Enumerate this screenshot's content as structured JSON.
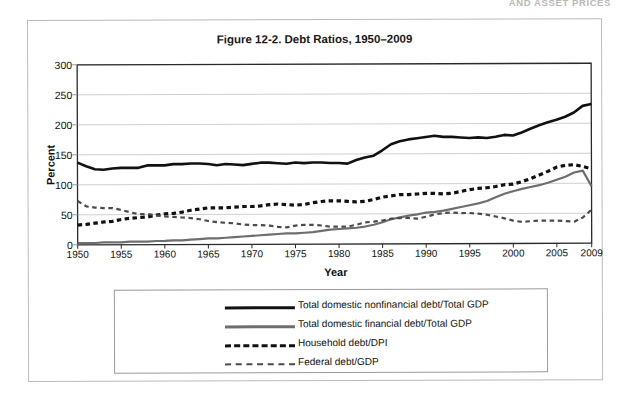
{
  "running_header": "AND ASSET PRICES",
  "figure": {
    "title": "Figure 12-2. Debt Ratios, 1950–2009"
  },
  "legend": {
    "items": [
      {
        "label": "Total domestic nonfinancial debt/Total GDP",
        "style": "solid-black",
        "color": "#111111"
      },
      {
        "label": "Total domestic financial debt/Total GDP",
        "style": "solid-gray",
        "color": "#6e6e6e"
      },
      {
        "label": "Household debt/DPI",
        "style": "dash-thick",
        "color": "#111111"
      },
      {
        "label": "Federal debt/GDP",
        "style": "dash-thin",
        "color": "#4a4a4a"
      }
    ]
  },
  "chart_data": {
    "type": "line",
    "title": "Figure 12-2. Debt Ratios, 1950–2009",
    "xlabel": "Year",
    "ylabel": "Percent",
    "xlim": [
      1950,
      2009
    ],
    "ylim": [
      0,
      300
    ],
    "yticks": [
      0,
      50,
      100,
      150,
      200,
      250,
      300
    ],
    "xticks": [
      1950,
      1955,
      1960,
      1965,
      1970,
      1975,
      1980,
      1985,
      1990,
      1995,
      2000,
      2005,
      2009
    ],
    "grid": "horizontal",
    "legend_position": "below",
    "x": [
      1950,
      1951,
      1952,
      1953,
      1954,
      1955,
      1956,
      1957,
      1958,
      1959,
      1960,
      1961,
      1962,
      1963,
      1964,
      1965,
      1966,
      1967,
      1968,
      1969,
      1970,
      1971,
      1972,
      1973,
      1974,
      1975,
      1976,
      1977,
      1978,
      1979,
      1980,
      1981,
      1982,
      1983,
      1984,
      1985,
      1986,
      1987,
      1988,
      1989,
      1990,
      1991,
      1992,
      1993,
      1994,
      1995,
      1996,
      1997,
      1998,
      1999,
      2000,
      2001,
      2002,
      2003,
      2004,
      2005,
      2006,
      2007,
      2008,
      2009
    ],
    "series": [
      {
        "name": "Total domestic nonfinancial debt/Total GDP",
        "style": "solid-black",
        "color": "#111111",
        "values": [
          137,
          131,
          126,
          125,
          127,
          128,
          128,
          128,
          132,
          132,
          132,
          134,
          134,
          135,
          135,
          134,
          132,
          134,
          133,
          132,
          134,
          136,
          136,
          135,
          134,
          136,
          135,
          136,
          136,
          135,
          135,
          134,
          140,
          144,
          147,
          156,
          166,
          171,
          174,
          176,
          178,
          180,
          178,
          178,
          177,
          176,
          177,
          176,
          178,
          181,
          180,
          185,
          191,
          197,
          202,
          206,
          211,
          218,
          229,
          232
        ]
      },
      {
        "name": "Total domestic financial debt/Total GDP",
        "style": "solid-gray",
        "color": "#6e6e6e",
        "values": [
          3,
          3,
          3,
          4,
          4,
          4,
          5,
          5,
          5,
          6,
          6,
          7,
          7,
          8,
          9,
          10,
          10,
          11,
          12,
          13,
          14,
          15,
          16,
          17,
          18,
          18,
          19,
          20,
          22,
          24,
          25,
          26,
          27,
          29,
          32,
          36,
          41,
          44,
          47,
          49,
          52,
          53,
          55,
          58,
          61,
          64,
          67,
          71,
          77,
          83,
          87,
          91,
          94,
          97,
          101,
          106,
          111,
          118,
          121,
          95
        ]
      },
      {
        "name": "Household debt/DPI",
        "style": "dash-thick",
        "color": "#111111",
        "values": [
          33,
          34,
          36,
          38,
          39,
          42,
          44,
          45,
          46,
          49,
          51,
          52,
          54,
          57,
          59,
          61,
          61,
          61,
          62,
          63,
          63,
          64,
          66,
          67,
          66,
          65,
          66,
          69,
          71,
          72,
          72,
          71,
          70,
          71,
          74,
          78,
          80,
          82,
          82,
          83,
          84,
          84,
          83,
          84,
          87,
          90,
          92,
          93,
          95,
          98,
          99,
          103,
          108,
          114,
          120,
          127,
          130,
          131,
          128,
          124
        ]
      },
      {
        "name": "Federal debt/GDP",
        "style": "dash-thin",
        "color": "#4a4a4a",
        "values": [
          73,
          64,
          62,
          61,
          61,
          58,
          54,
          51,
          51,
          49,
          47,
          46,
          45,
          44,
          42,
          39,
          37,
          36,
          35,
          33,
          32,
          32,
          31,
          29,
          28,
          31,
          32,
          32,
          31,
          29,
          29,
          29,
          32,
          36,
          37,
          39,
          42,
          43,
          43,
          42,
          45,
          49,
          51,
          52,
          51,
          51,
          50,
          48,
          45,
          42,
          38,
          36,
          37,
          38,
          38,
          38,
          37,
          36,
          43,
          56
        ]
      }
    ]
  }
}
